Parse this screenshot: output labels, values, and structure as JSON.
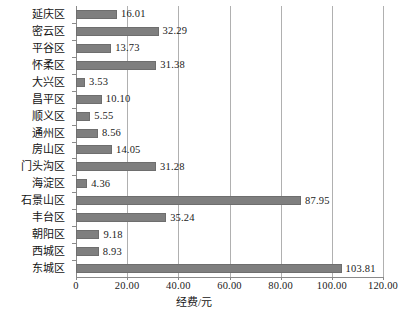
{
  "chart_data": {
    "type": "bar",
    "orientation": "horizontal",
    "title": "",
    "xlabel": "经费/元",
    "ylabel": "",
    "xlim": [
      0,
      120
    ],
    "xticks": [
      "0",
      "20.00",
      "40.00",
      "60.00",
      "80.00",
      "100.00",
      "120.00"
    ],
    "xtick_values": [
      0,
      20,
      40,
      60,
      80,
      100,
      120
    ],
    "grid": "vertical",
    "legend": "none",
    "bar_color": "#7f7f7f",
    "categories": [
      "延庆区",
      "密云区",
      "平谷区",
      "怀柔区",
      "大兴区",
      "昌平区",
      "顺义区",
      "通州区",
      "房山区",
      "门头沟区",
      "海淀区",
      "石景山区",
      "丰台区",
      "朝阳区",
      "西城区",
      "东城区"
    ],
    "values": [
      16.01,
      32.29,
      13.73,
      31.38,
      3.53,
      10.1,
      5.55,
      8.56,
      14.05,
      31.28,
      4.36,
      87.95,
      35.24,
      9.18,
      8.93,
      103.81
    ],
    "value_labels": [
      "16.01",
      "32.29",
      "13.73",
      "31.38",
      "3.53",
      "10.10",
      "5.55",
      "8.56",
      "14.05",
      "31.28",
      "4.36",
      "87.95",
      "35.24",
      "9.18",
      "8.93",
      "103.81"
    ]
  }
}
